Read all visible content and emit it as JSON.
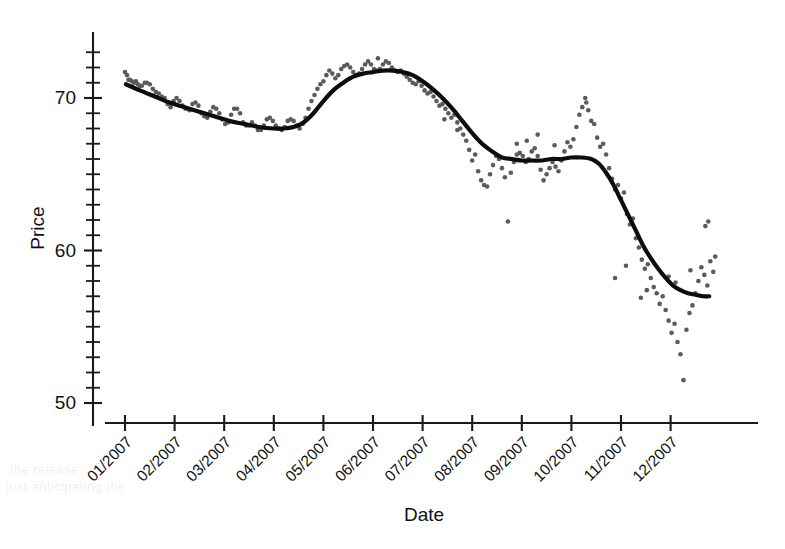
{
  "chart_data": {
    "type": "scatter",
    "title": "",
    "xlabel": "Date",
    "ylabel": "Price",
    "grid": false,
    "legend": "none",
    "ylim": [
      50,
      73.2
    ],
    "yticks": [
      50,
      60,
      70
    ],
    "ytick_labels": [
      "50",
      "60",
      "70"
    ],
    "y_minor_tick_step": 1,
    "xlim_months": [
      1,
      12.9
    ],
    "xticks": [
      1,
      2,
      3,
      4,
      5,
      6,
      7,
      8,
      9,
      10,
      11,
      12
    ],
    "xtick_labels": [
      "01/2007",
      "02/2007",
      "03/2007",
      "04/2007",
      "05/2007",
      "06/2007",
      "07/2007",
      "08/2007",
      "09/2007",
      "10/2007",
      "11/2007",
      "12/2007"
    ],
    "xtick_label_rotation_deg": 45,
    "series": [
      {
        "name": "Price observations",
        "type": "scatter",
        "marker": "circle",
        "color": "#5b5b5b",
        "marker_size_px": 4.6,
        "points": [
          [
            1.0,
            71.7
          ],
          [
            1.04,
            71.5
          ],
          [
            1.07,
            71.2
          ],
          [
            1.1,
            71.2
          ],
          [
            1.14,
            71.1
          ],
          [
            1.18,
            71.0
          ],
          [
            1.22,
            71.1
          ],
          [
            1.26,
            70.9
          ],
          [
            1.3,
            70.8
          ],
          [
            1.34,
            70.8
          ],
          [
            1.4,
            71.0
          ],
          [
            1.44,
            71.0
          ],
          [
            1.5,
            70.9
          ],
          [
            1.56,
            70.6
          ],
          [
            1.62,
            70.4
          ],
          [
            1.68,
            70.3
          ],
          [
            1.74,
            70.1
          ],
          [
            1.8,
            70.0
          ],
          [
            1.86,
            69.6
          ],
          [
            1.92,
            69.4
          ],
          [
            1.98,
            69.8
          ],
          [
            2.04,
            70.0
          ],
          [
            2.1,
            69.8
          ],
          [
            2.16,
            69.5
          ],
          [
            2.22,
            69.3
          ],
          [
            2.3,
            69.2
          ],
          [
            2.36,
            69.6
          ],
          [
            2.42,
            69.7
          ],
          [
            2.48,
            69.5
          ],
          [
            2.54,
            69.0
          ],
          [
            2.6,
            68.8
          ],
          [
            2.66,
            68.7
          ],
          [
            2.72,
            69.1
          ],
          [
            2.78,
            69.4
          ],
          [
            2.84,
            69.3
          ],
          [
            2.9,
            69.0
          ],
          [
            2.96,
            68.6
          ],
          [
            3.02,
            68.3
          ],
          [
            3.08,
            68.4
          ],
          [
            3.14,
            68.9
          ],
          [
            3.2,
            69.3
          ],
          [
            3.26,
            69.3
          ],
          [
            3.32,
            69.0
          ],
          [
            3.38,
            68.4
          ],
          [
            3.44,
            68.2
          ],
          [
            3.5,
            68.2
          ],
          [
            3.56,
            68.4
          ],
          [
            3.62,
            68.2
          ],
          [
            3.68,
            67.9
          ],
          [
            3.74,
            67.9
          ],
          [
            3.8,
            68.2
          ],
          [
            3.86,
            68.6
          ],
          [
            3.92,
            68.7
          ],
          [
            3.98,
            68.5
          ],
          [
            4.04,
            68.2
          ],
          [
            4.1,
            68.0
          ],
          [
            4.16,
            67.9
          ],
          [
            4.22,
            68.1
          ],
          [
            4.28,
            68.5
          ],
          [
            4.34,
            68.6
          ],
          [
            4.4,
            68.5
          ],
          [
            4.46,
            68.2
          ],
          [
            4.52,
            68.0
          ],
          [
            4.58,
            68.3
          ],
          [
            4.64,
            68.7
          ],
          [
            4.7,
            69.3
          ],
          [
            4.76,
            69.8
          ],
          [
            4.82,
            70.2
          ],
          [
            4.88,
            70.6
          ],
          [
            4.94,
            70.9
          ],
          [
            5.0,
            71.1
          ],
          [
            5.06,
            71.5
          ],
          [
            5.12,
            71.8
          ],
          [
            5.18,
            71.6
          ],
          [
            5.24,
            71.3
          ],
          [
            5.3,
            71.5
          ],
          [
            5.36,
            71.9
          ],
          [
            5.42,
            72.1
          ],
          [
            5.48,
            72.2
          ],
          [
            5.54,
            72.0
          ],
          [
            5.6,
            71.7
          ],
          [
            5.66,
            71.5
          ],
          [
            5.72,
            71.6
          ],
          [
            5.78,
            71.9
          ],
          [
            5.84,
            72.2
          ],
          [
            5.9,
            72.4
          ],
          [
            5.96,
            72.2
          ],
          [
            6.02,
            71.9
          ],
          [
            6.08,
            71.8
          ],
          [
            6.14,
            71.9
          ],
          [
            6.2,
            72.2
          ],
          [
            6.26,
            72.4
          ],
          [
            6.32,
            72.3
          ],
          [
            6.38,
            72.0
          ],
          [
            6.44,
            71.8
          ],
          [
            6.5,
            71.7
          ],
          [
            6.56,
            71.8
          ],
          [
            6.62,
            71.6
          ],
          [
            6.68,
            71.4
          ],
          [
            6.74,
            71.2
          ],
          [
            6.8,
            71.0
          ],
          [
            6.86,
            70.9
          ],
          [
            6.92,
            71.1
          ],
          [
            6.98,
            70.8
          ],
          [
            7.04,
            70.5
          ],
          [
            7.1,
            70.3
          ],
          [
            7.16,
            70.4
          ],
          [
            7.22,
            70.1
          ],
          [
            7.28,
            69.8
          ],
          [
            7.34,
            69.5
          ],
          [
            7.4,
            69.6
          ],
          [
            7.46,
            69.3
          ],
          [
            7.52,
            69.0
          ],
          [
            7.58,
            68.7
          ],
          [
            7.64,
            68.9
          ],
          [
            7.7,
            68.4
          ],
          [
            7.76,
            68.0
          ],
          [
            7.82,
            67.6
          ],
          [
            7.88,
            67.2
          ],
          [
            7.94,
            66.6
          ],
          [
            8.0,
            65.9
          ],
          [
            8.06,
            66.3
          ],
          [
            8.12,
            65.2
          ],
          [
            8.18,
            64.6
          ],
          [
            8.24,
            64.3
          ],
          [
            8.3,
            64.2
          ],
          [
            8.36,
            65.0
          ],
          [
            8.42,
            65.6
          ],
          [
            8.48,
            66.2
          ],
          [
            8.54,
            66.0
          ],
          [
            8.6,
            65.4
          ],
          [
            8.66,
            64.8
          ],
          [
            8.72,
            61.9
          ],
          [
            8.78,
            65.1
          ],
          [
            8.84,
            65.8
          ],
          [
            8.9,
            66.3
          ],
          [
            8.96,
            66.4
          ],
          [
            9.02,
            66.2
          ],
          [
            9.08,
            65.8
          ],
          [
            9.14,
            66.0
          ],
          [
            9.2,
            66.5
          ],
          [
            9.26,
            66.7
          ],
          [
            9.32,
            66.2
          ],
          [
            9.38,
            65.3
          ],
          [
            9.44,
            64.6
          ],
          [
            9.5,
            65.0
          ],
          [
            9.56,
            65.4
          ],
          [
            9.62,
            65.8
          ],
          [
            9.68,
            65.5
          ],
          [
            9.74,
            65.2
          ],
          [
            9.8,
            65.9
          ],
          [
            9.86,
            66.5
          ],
          [
            9.92,
            67.1
          ],
          [
            9.98,
            66.8
          ],
          [
            10.04,
            67.3
          ],
          [
            10.1,
            68.1
          ],
          [
            10.16,
            68.9
          ],
          [
            10.22,
            69.4
          ],
          [
            10.28,
            70.0
          ],
          [
            10.34,
            69.2
          ],
          [
            10.4,
            68.5
          ],
          [
            10.46,
            68.3
          ],
          [
            10.52,
            67.4
          ],
          [
            10.58,
            66.8
          ],
          [
            10.64,
            67.0
          ],
          [
            10.7,
            66.3
          ],
          [
            10.76,
            65.4
          ],
          [
            10.82,
            64.7
          ],
          [
            10.88,
            64.0
          ],
          [
            10.94,
            64.3
          ],
          [
            11.0,
            63.4
          ],
          [
            11.06,
            63.8
          ],
          [
            11.12,
            62.4
          ],
          [
            11.18,
            61.7
          ],
          [
            11.24,
            62.1
          ],
          [
            11.3,
            60.8
          ],
          [
            11.36,
            60.2
          ],
          [
            11.42,
            59.4
          ],
          [
            11.48,
            58.8
          ],
          [
            11.54,
            59.1
          ],
          [
            11.6,
            58.2
          ],
          [
            11.66,
            57.6
          ],
          [
            11.72,
            57.2
          ],
          [
            11.78,
            56.5
          ],
          [
            11.84,
            57.0
          ],
          [
            11.9,
            56.1
          ],
          [
            11.96,
            55.4
          ],
          [
            12.02,
            54.6
          ],
          [
            12.08,
            55.2
          ],
          [
            12.14,
            54.0
          ],
          [
            12.2,
            53.2
          ],
          [
            12.26,
            51.5
          ],
          [
            12.32,
            54.8
          ],
          [
            12.38,
            55.9
          ],
          [
            12.44,
            56.4
          ],
          [
            12.5,
            57.2
          ],
          [
            12.56,
            58.0
          ],
          [
            12.62,
            58.9
          ],
          [
            12.68,
            58.4
          ],
          [
            12.74,
            57.7
          ],
          [
            12.8,
            59.3
          ],
          [
            12.86,
            58.6
          ],
          [
            12.9,
            59.6
          ],
          [
            9.1,
            67.2
          ],
          [
            9.32,
            67.6
          ],
          [
            10.88,
            58.2
          ],
          [
            11.1,
            59.0
          ],
          [
            11.96,
            58.3
          ],
          [
            12.4,
            58.7
          ],
          [
            12.7,
            61.6
          ],
          [
            12.76,
            61.9
          ],
          [
            12.1,
            57.9
          ],
          [
            11.4,
            56.9
          ],
          [
            11.52,
            57.4
          ],
          [
            8.9,
            67.0
          ],
          [
            9.66,
            66.9
          ],
          [
            10.3,
            69.7
          ],
          [
            7.7,
            67.9
          ],
          [
            7.44,
            68.6
          ],
          [
            6.1,
            72.6
          ]
        ]
      },
      {
        "name": "Loess trend",
        "type": "line",
        "color": "#0d0d0d",
        "linewidth_px": 4.2,
        "points": [
          [
            1.02,
            70.9
          ],
          [
            1.3,
            70.5
          ],
          [
            1.6,
            70.1
          ],
          [
            1.9,
            69.7
          ],
          [
            2.2,
            69.4
          ],
          [
            2.5,
            69.1
          ],
          [
            2.8,
            68.8
          ],
          [
            3.1,
            68.5
          ],
          [
            3.4,
            68.3
          ],
          [
            3.7,
            68.1
          ],
          [
            4.0,
            68.0
          ],
          [
            4.2,
            68.0
          ],
          [
            4.4,
            68.1
          ],
          [
            4.6,
            68.4
          ],
          [
            4.8,
            69.0
          ],
          [
            5.0,
            69.8
          ],
          [
            5.2,
            70.5
          ],
          [
            5.4,
            71.0
          ],
          [
            5.6,
            71.4
          ],
          [
            5.8,
            71.6
          ],
          [
            6.0,
            71.7
          ],
          [
            6.2,
            71.8
          ],
          [
            6.4,
            71.8
          ],
          [
            6.6,
            71.7
          ],
          [
            6.8,
            71.5
          ],
          [
            7.0,
            71.1
          ],
          [
            7.2,
            70.6
          ],
          [
            7.4,
            70.0
          ],
          [
            7.6,
            69.3
          ],
          [
            7.8,
            68.5
          ],
          [
            8.0,
            67.7
          ],
          [
            8.2,
            67.0
          ],
          [
            8.4,
            66.5
          ],
          [
            8.6,
            66.1
          ],
          [
            8.8,
            66.0
          ],
          [
            9.0,
            65.9
          ],
          [
            9.2,
            65.9
          ],
          [
            9.4,
            65.9
          ],
          [
            9.6,
            66.0
          ],
          [
            9.8,
            66.0
          ],
          [
            10.0,
            66.1
          ],
          [
            10.2,
            66.1
          ],
          [
            10.4,
            66.0
          ],
          [
            10.55,
            65.7
          ],
          [
            10.7,
            65.1
          ],
          [
            10.85,
            64.3
          ],
          [
            11.0,
            63.3
          ],
          [
            11.15,
            62.3
          ],
          [
            11.3,
            61.3
          ],
          [
            11.45,
            60.3
          ],
          [
            11.6,
            59.5
          ],
          [
            11.75,
            58.8
          ],
          [
            11.9,
            58.2
          ],
          [
            12.05,
            57.7
          ],
          [
            12.2,
            57.4
          ],
          [
            12.35,
            57.2
          ],
          [
            12.5,
            57.1
          ],
          [
            12.65,
            57.0
          ],
          [
            12.78,
            57.0
          ]
        ]
      }
    ]
  },
  "bleed_artifacts": [
    {
      "text": "the release",
      "x": 10,
      "y": 462
    },
    {
      "text": "just anticipating the",
      "x": 6,
      "y": 479
    }
  ]
}
